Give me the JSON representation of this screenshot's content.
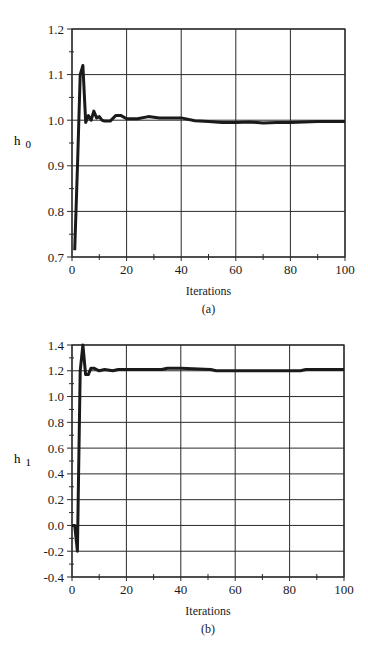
{
  "chart_data": [
    {
      "type": "line",
      "panel": "(a)",
      "caption": "(a)",
      "title": "",
      "xlabel": "Iterations",
      "ylabel": "h",
      "ylabel_subscript": "0",
      "xlim": [
        0,
        100
      ],
      "ylim": [
        0.7,
        1.2
      ],
      "xticks": [
        "0",
        "20",
        "40",
        "60",
        "80",
        "100"
      ],
      "yticks": [
        "0.7",
        "0.8",
        "0.9",
        "1.0",
        "1.1",
        "1.2"
      ],
      "x_minor_step": 10,
      "y_minor_step": 0.05,
      "grid": true,
      "legend": null,
      "series": [
        {
          "name": "h0",
          "x": [
            1,
            2,
            3,
            4,
            5,
            6,
            7,
            8,
            9,
            10,
            11,
            12,
            14,
            16,
            18,
            20,
            24,
            28,
            32,
            36,
            40,
            45,
            50,
            55,
            60,
            65,
            70,
            75,
            80,
            85,
            90,
            100
          ],
          "values": [
            0.715,
            0.9,
            1.1,
            1.12,
            0.995,
            1.01,
            1.0,
            1.02,
            1.005,
            1.008,
            1.0,
            0.998,
            0.998,
            1.01,
            1.01,
            1.003,
            1.003,
            1.008,
            1.005,
            1.005,
            1.005,
            0.999,
            0.997,
            0.995,
            0.995,
            0.996,
            0.994,
            0.995,
            0.995,
            0.996,
            0.997,
            0.997
          ]
        }
      ]
    },
    {
      "type": "line",
      "panel": "(b)",
      "caption": "(b)",
      "title": "",
      "xlabel": "Iterations",
      "ylabel": "h",
      "ylabel_subscript": "1",
      "xlim": [
        0,
        100
      ],
      "ylim": [
        -0.4,
        1.4
      ],
      "xticks": [
        "0",
        "20",
        "40",
        "60",
        "80",
        "100"
      ],
      "yticks": [
        "-0.4",
        "-0.2",
        "0.0",
        "0.2",
        "0.4",
        "0.6",
        "0.8",
        "1.0",
        "1.2",
        "1.4"
      ],
      "x_minor_step": 10,
      "y_minor_step": 0.1,
      "grid": true,
      "legend": null,
      "series": [
        {
          "name": "h1",
          "x": [
            0,
            1,
            2,
            3,
            4,
            5,
            6,
            7,
            8,
            10,
            12,
            15,
            17,
            25,
            33,
            35,
            40,
            51,
            53,
            60,
            70,
            80,
            84,
            86,
            100
          ],
          "values": [
            0.0,
            0.0,
            -0.2,
            1.2,
            1.4,
            1.17,
            1.17,
            1.22,
            1.22,
            1.2,
            1.21,
            1.2,
            1.21,
            1.21,
            1.21,
            1.22,
            1.22,
            1.21,
            1.2,
            1.2,
            1.2,
            1.2,
            1.2,
            1.21,
            1.21
          ]
        }
      ]
    }
  ],
  "layout": {
    "line_color": "#1a1a1a",
    "grid_color": "#2a2a2a",
    "panels": [
      {
        "x0": 72,
        "x1": 345,
        "ytop": 29,
        "ybot": 257
      },
      {
        "x0": 72,
        "x1": 344,
        "ytop": 345,
        "ybot": 577
      }
    ]
  }
}
